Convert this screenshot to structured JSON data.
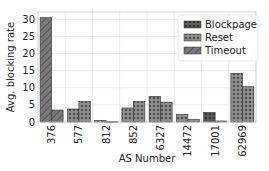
{
  "chart_data": {
    "type": "bar",
    "title": "",
    "xlabel": "AS Number",
    "ylabel": "Avg. blocking rate",
    "ylim": [
      0,
      32
    ],
    "yticks": [
      0,
      5,
      10,
      15,
      20,
      25,
      30
    ],
    "grid": true,
    "legend_position": "upper right",
    "legend": [
      {
        "name": "Blockpage",
        "color": "#5a5a5a",
        "pattern": "dots"
      },
      {
        "name": "Reset",
        "color": "#8c8c8c",
        "pattern": "dots"
      },
      {
        "name": "Timeout",
        "color": "#7a7a7a",
        "pattern": "hatch"
      }
    ],
    "categories": [
      "376",
      "577",
      "812",
      "852",
      "6327",
      "14472",
      "17001",
      "62969"
    ],
    "bars_per_category": 2,
    "groups": [
      {
        "category": "376",
        "bars": [
          {
            "type": "Timeout",
            "value": 30.5
          },
          {
            "type": "Timeout",
            "value": 3.5
          }
        ]
      },
      {
        "category": "577",
        "bars": [
          {
            "type": "Reset",
            "value": 3.8
          },
          {
            "type": "Reset",
            "value": 6.0
          }
        ]
      },
      {
        "category": "812",
        "bars": [
          {
            "type": "Reset",
            "value": 0.5
          },
          {
            "type": "Reset",
            "value": 0.1
          }
        ]
      },
      {
        "category": "852",
        "bars": [
          {
            "type": "Reset",
            "value": 4.1
          },
          {
            "type": "Reset",
            "value": 6.0
          }
        ]
      },
      {
        "category": "6327",
        "bars": [
          {
            "type": "Reset",
            "value": 7.5
          },
          {
            "type": "Reset",
            "value": 5.8
          }
        ]
      },
      {
        "category": "14472",
        "bars": [
          {
            "type": "Reset",
            "value": 2.2
          },
          {
            "type": "Reset",
            "value": 0.8
          }
        ]
      },
      {
        "category": "17001",
        "bars": [
          {
            "type": "Blockpage",
            "value": 2.8
          },
          {
            "type": "Reset",
            "value": 0.3
          }
        ]
      },
      {
        "category": "62969",
        "bars": [
          {
            "type": "Reset",
            "value": 14.2
          },
          {
            "type": "Reset",
            "value": 10.3
          }
        ]
      }
    ]
  }
}
